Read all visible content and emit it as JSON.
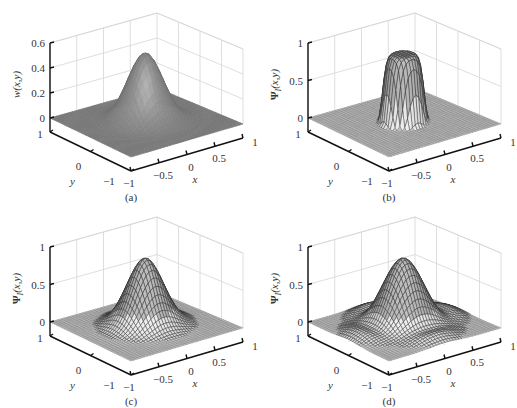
{
  "figure": {
    "background": "#ffffff",
    "panels": [
      {
        "id": "a",
        "caption": "(a)",
        "zlabel": "w(x,y)",
        "zlabel_bold_symbol": "",
        "style": "shaded"
      },
      {
        "id": "b",
        "caption": "(b)",
        "zlabel": "(x,y)",
        "zlabel_bold_symbol": "Ψ",
        "zlabel_sub": "I",
        "style": "mesh"
      },
      {
        "id": "c",
        "caption": "(c)",
        "zlabel": "(x,y)",
        "zlabel_bold_symbol": "Ψ",
        "zlabel_sub": "I",
        "style": "mesh"
      },
      {
        "id": "d",
        "caption": "(d)",
        "zlabel": "(x,y)",
        "zlabel_bold_symbol": "Ψ",
        "zlabel_sub": "I",
        "style": "mesh"
      }
    ]
  },
  "chart_data": [
    {
      "type": "surface",
      "panel": "a",
      "title": "",
      "caption": "(a)",
      "xlabel": "x",
      "ylabel": "y",
      "zlabel": "w(x,y)",
      "xlim": [
        -1,
        1
      ],
      "ylim": [
        -1,
        1
      ],
      "zlim": [
        0,
        0.6
      ],
      "xticks": [
        "-1",
        "-0.5",
        "0",
        "0.5",
        "1"
      ],
      "yticks": [
        "-1",
        "0",
        "1"
      ],
      "zticks": [
        "0",
        "0.2",
        "0.4",
        "0.6"
      ],
      "zticks_values": [
        0,
        0.2,
        0.4,
        0.6
      ],
      "surface": "gaussian bump centered at (0,0), peak ≈ 0.55, width σ≈0.25",
      "peak": 0.55,
      "sigma": 0.26,
      "rendering": "shaded surface (gray)",
      "grid": true
    },
    {
      "type": "surface",
      "panel": "b",
      "caption": "(b)",
      "xlabel": "x",
      "ylabel": "y",
      "zlabel": "ΨI(x,y)",
      "xlim": [
        -1,
        1
      ],
      "ylim": [
        -1,
        1
      ],
      "zlim": [
        0,
        1
      ],
      "xticks": [
        "-1",
        "-0.5",
        "0",
        "0.5",
        "1"
      ],
      "yticks": [
        "-1",
        "0",
        "1"
      ],
      "zticks": [
        "0",
        "0.5",
        "1"
      ],
      "zticks_values": [
        0,
        0.5,
        1
      ],
      "surface": "flat-topped bump centered at (0,0), peak ≈ 0.9, steep sides, radius ≈ 0.35",
      "peak": 0.9,
      "sigma": 0.22,
      "power": 4,
      "rendering": "wireframe mesh",
      "grid": true
    },
    {
      "type": "surface",
      "panel": "c",
      "caption": "(c)",
      "xlabel": "x",
      "ylabel": "y",
      "zlabel": "ΨI(x,y)",
      "xlim": [
        -1,
        1
      ],
      "ylim": [
        -1,
        1
      ],
      "zlim": [
        0,
        1
      ],
      "xticks": [
        "-1",
        "-0.5",
        "0",
        "0.5",
        "1"
      ],
      "yticks": [
        "-1",
        "0",
        "1"
      ],
      "zticks": [
        "0",
        "0.5",
        "1"
      ],
      "zticks_values": [
        0,
        0.5,
        1
      ],
      "surface": "gaussian-like bump centered at (0,0), peak ≈ 0.9",
      "peak": 0.9,
      "sigma": 0.27,
      "power": 2,
      "rendering": "wireframe mesh",
      "grid": true
    },
    {
      "type": "surface",
      "panel": "d",
      "caption": "(d)",
      "xlabel": "x",
      "ylabel": "y",
      "zlabel": "ΨI(x,y)",
      "xlim": [
        -1,
        1
      ],
      "ylim": [
        -1,
        1
      ],
      "zlim": [
        0,
        1
      ],
      "xticks": [
        "-1",
        "-0.5",
        "0",
        "0.5",
        "1"
      ],
      "yticks": [
        "-1",
        "0",
        "1"
      ],
      "zticks": [
        "0",
        "0.5",
        "1"
      ],
      "zticks_values": [
        0,
        0.5,
        1
      ],
      "surface": "central peak ≈ 0.9 with surrounding ring ripples (sinc-like)",
      "peak": 0.9,
      "sigma": 0.3,
      "ripple": 0.12,
      "rendering": "wireframe mesh",
      "grid": true
    }
  ]
}
